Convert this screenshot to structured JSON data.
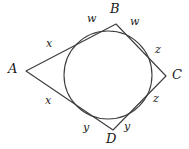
{
  "figure": {
    "type": "tangential-quadrilateral-with-inscribed-circle",
    "background_color": "#ffffff",
    "stroke_color": "#3c3c3c",
    "label_color": "#1a1a1a",
    "circle": {
      "cx": 108,
      "cy": 75,
      "r": 44
    },
    "quadrilateral": {
      "vertices": [
        {
          "name": "A",
          "x": 26,
          "y": 71
        },
        {
          "name": "B",
          "x": 116,
          "y": 24
        },
        {
          "name": "C",
          "x": 166,
          "y": 76
        },
        {
          "name": "D",
          "x": 113,
          "y": 130
        }
      ],
      "path": "M 26 71 L 116 24 L 166 76 L 113 130 Z"
    },
    "vertex_labels": [
      {
        "text": "A",
        "x": 8,
        "y": 62
      },
      {
        "text": "B",
        "x": 110,
        "y": 2
      },
      {
        "text": "C",
        "x": 172,
        "y": 68
      },
      {
        "text": "D",
        "x": 106,
        "y": 132
      }
    ],
    "segment_labels": [
      {
        "text": "w",
        "x": 87,
        "y": 13
      },
      {
        "text": "w",
        "x": 130,
        "y": 16
      },
      {
        "text": "x",
        "x": 46,
        "y": 38
      },
      {
        "text": "x",
        "x": 45,
        "y": 95
      },
      {
        "text": "z",
        "x": 155,
        "y": 44
      },
      {
        "text": "z",
        "x": 153,
        "y": 93
      },
      {
        "text": "y",
        "x": 83,
        "y": 122
      },
      {
        "text": "y",
        "x": 124,
        "y": 121
      }
    ]
  }
}
